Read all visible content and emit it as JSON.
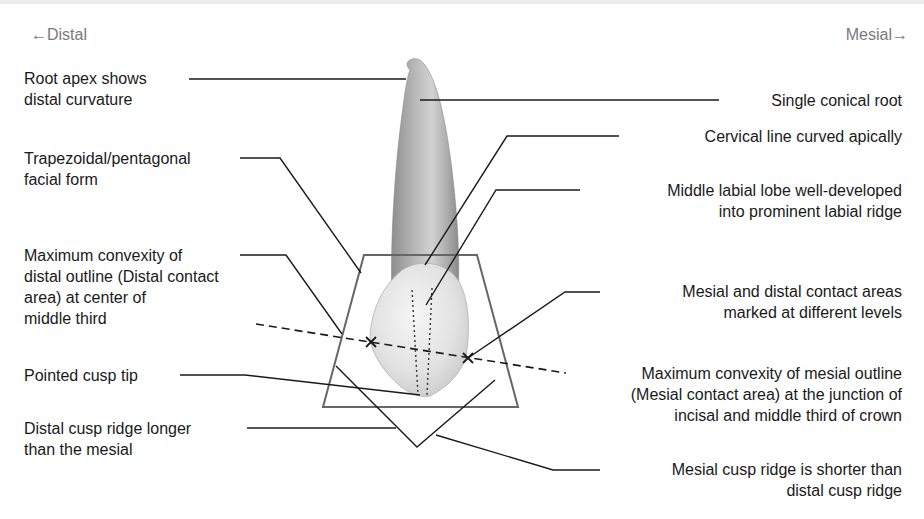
{
  "orientation": {
    "left": "←Distal",
    "right": "Mesial→"
  },
  "labels_left": [
    {
      "id": "root-apex",
      "lines": [
        "Root apex shows",
        "distal curvature"
      ]
    },
    {
      "id": "facial-form",
      "lines": [
        "Trapezoidal/pentagonal",
        "facial form"
      ]
    },
    {
      "id": "distal-convexity",
      "lines": [
        "Maximum convexity of",
        "distal outline (Distal contact",
        "area) at center of",
        "middle third"
      ]
    },
    {
      "id": "cusp-tip",
      "lines": [
        "Pointed cusp tip"
      ]
    },
    {
      "id": "distal-ridge",
      "lines": [
        "Distal cusp ridge longer",
        "than the mesial"
      ]
    }
  ],
  "labels_right": [
    {
      "id": "conical-root",
      "lines": [
        "Single conical root"
      ]
    },
    {
      "id": "cervical-line",
      "lines": [
        "Cervical line curved apically"
      ]
    },
    {
      "id": "labial-lobe",
      "lines": [
        "Middle labial lobe well-developed",
        "into prominent labial ridge"
      ]
    },
    {
      "id": "contact-areas",
      "lines": [
        "Mesial and distal contact areas",
        "marked at different levels"
      ]
    },
    {
      "id": "mesial-convexity",
      "lines": [
        "Maximum convexity of mesial outline",
        "(Mesial contact area) at the junction of",
        "incisal and middle third of crown"
      ]
    },
    {
      "id": "mesial-ridge",
      "lines": [
        "Mesial cusp ridge is shorter than",
        "distal cusp ridge"
      ]
    }
  ],
  "colors": {
    "text": "#1a1a1a",
    "direction_text": "#7a7a7a",
    "leader": "#1a1a1a",
    "outline_box": "#666666",
    "root_shade": "#9a9a9a",
    "crown_shade": "#e6e6e6"
  }
}
